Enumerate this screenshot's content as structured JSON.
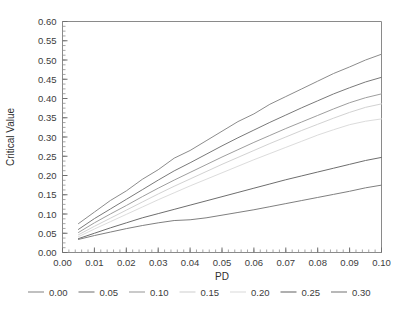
{
  "chart_data": {
    "type": "line",
    "title": "",
    "xlabel": "PD",
    "ylabel": "Critical Value",
    "xlim": [
      0.0,
      0.1
    ],
    "ylim": [
      0.0,
      0.6
    ],
    "grid": false,
    "legend_position": "bottom",
    "x_ticks": [
      "0.00",
      "0.01",
      "0.02",
      "0.03",
      "0.04",
      "0.05",
      "0.06",
      "0.07",
      "0.08",
      "0.09",
      "0.10"
    ],
    "x_tick_values": [
      0.0,
      0.01,
      0.02,
      0.03,
      0.04,
      0.05,
      0.06,
      0.07,
      0.08,
      0.09,
      0.1
    ],
    "x_minor_step": 0.002,
    "y_ticks": [
      "0.00",
      "0.05",
      "0.10",
      "0.15",
      "0.20",
      "0.25",
      "0.30",
      "0.35",
      "0.40",
      "0.45",
      "0.50",
      "0.55",
      "0.60"
    ],
    "y_tick_values": [
      0.0,
      0.05,
      0.1,
      0.15,
      0.2,
      0.25,
      0.3,
      0.35,
      0.4,
      0.45,
      0.5,
      0.55,
      0.6
    ],
    "y_minor_step": 0.0125,
    "x": [
      0.005,
      0.01,
      0.015,
      0.02,
      0.025,
      0.03,
      0.035,
      0.04,
      0.045,
      0.05,
      0.055,
      0.06,
      0.065,
      0.07,
      0.075,
      0.08,
      0.085,
      0.09,
      0.095,
      0.1
    ],
    "series": [
      {
        "name": "0.00",
        "color": "#8c8c8c",
        "values": [
          0.075,
          0.105,
          0.135,
          0.16,
          0.19,
          0.215,
          0.245,
          0.265,
          0.29,
          0.315,
          0.34,
          0.36,
          0.385,
          0.405,
          0.425,
          0.445,
          0.465,
          0.482,
          0.5,
          0.515
        ]
      },
      {
        "name": "0.05",
        "color": "#7a7a7a",
        "values": [
          0.06,
          0.088,
          0.113,
          0.138,
          0.163,
          0.188,
          0.212,
          0.233,
          0.255,
          0.277,
          0.298,
          0.318,
          0.338,
          0.357,
          0.376,
          0.394,
          0.412,
          0.428,
          0.443,
          0.455
        ]
      },
      {
        "name": "0.10",
        "color": "#9e9e9e",
        "values": [
          0.052,
          0.077,
          0.1,
          0.122,
          0.145,
          0.167,
          0.188,
          0.208,
          0.228,
          0.248,
          0.267,
          0.286,
          0.304,
          0.322,
          0.339,
          0.356,
          0.373,
          0.389,
          0.402,
          0.412
        ]
      },
      {
        "name": "0.15",
        "color": "#d2d2d2",
        "values": [
          0.046,
          0.068,
          0.089,
          0.11,
          0.131,
          0.152,
          0.172,
          0.191,
          0.21,
          0.229,
          0.247,
          0.265,
          0.283,
          0.3,
          0.317,
          0.333,
          0.349,
          0.364,
          0.377,
          0.386
        ]
      },
      {
        "name": "0.20",
        "color": "#dcdcdc",
        "values": [
          0.041,
          0.061,
          0.08,
          0.099,
          0.118,
          0.137,
          0.155,
          0.173,
          0.19,
          0.207,
          0.224,
          0.241,
          0.257,
          0.273,
          0.289,
          0.305,
          0.319,
          0.332,
          0.341,
          0.347
        ]
      },
      {
        "name": "0.25",
        "color": "#6e6e6e",
        "values": [
          0.036,
          0.05,
          0.064,
          0.077,
          0.09,
          0.101,
          0.112,
          0.123,
          0.134,
          0.145,
          0.156,
          0.167,
          0.178,
          0.189,
          0.199,
          0.209,
          0.219,
          0.229,
          0.239,
          0.247
        ]
      },
      {
        "name": "0.30",
        "color": "#7f7f7f",
        "values": [
          0.034,
          0.044,
          0.053,
          0.062,
          0.07,
          0.077,
          0.083,
          0.085,
          0.09,
          0.097,
          0.104,
          0.111,
          0.119,
          0.127,
          0.135,
          0.143,
          0.151,
          0.159,
          0.168,
          0.175
        ]
      }
    ]
  },
  "legend": {
    "items": [
      {
        "label": "0.00"
      },
      {
        "label": "0.05"
      },
      {
        "label": "0.10"
      },
      {
        "label": "0.15"
      },
      {
        "label": "0.20"
      },
      {
        "label": "0.25"
      },
      {
        "label": "0.30"
      }
    ]
  }
}
